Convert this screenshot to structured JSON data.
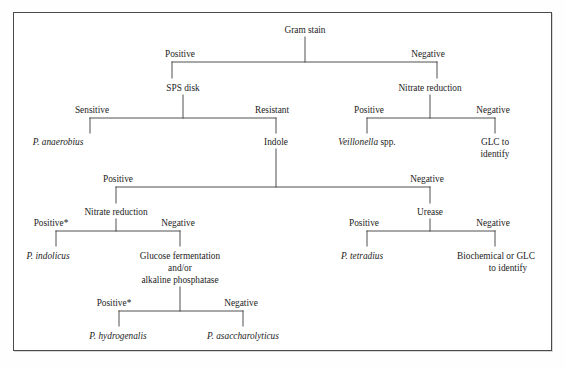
{
  "diagram": {
    "type": "decision-tree",
    "frame_color": "#4a4a4a",
    "line_color": "#3c3c3c",
    "text_color": "#1c1c1c",
    "nodes": {
      "gram_stain": "Gram stain",
      "gram_positive": "Positive",
      "gram_negative": "Negative",
      "sps_disk": "SPS disk",
      "sps_sensitive": "Sensitive",
      "sps_resistant": "Resistant",
      "p_anaerobius": "P. anaerobius",
      "indole": "Indole",
      "nitrate_reduction_top": "Nitrate reduction",
      "nitrate_top_positive": "Positive",
      "nitrate_top_negative": "Negative",
      "veillonella_name": "Veillonella",
      "veillonella_spp": " spp.",
      "glc_line1": "GLC to",
      "glc_line2": "identify",
      "indole_positive": "Positive",
      "indole_negative": "Negative",
      "nitrate_reduction_low": "Nitrate reduction",
      "nitrate_low_positive": "Positive*",
      "nitrate_low_negative": "Negative",
      "p_indolicus": "P. indolicus",
      "glucose_line1": "Glucose fermentation",
      "glucose_line2": "and/or",
      "glucose_line3": "alkaline phosphatase",
      "glucose_positive": "Positive*",
      "glucose_negative": "Negative",
      "p_hydrogenalis": "P. hydrogenalis",
      "p_asaccharolyticus": "P. asaccharolyticus",
      "urease": "Urease",
      "urease_positive": "Positive",
      "urease_negative": "Negative",
      "p_tetradius": "P. tetradius",
      "biochem_line1": "Biochemical or GLC",
      "biochem_line2": "to identify"
    }
  }
}
